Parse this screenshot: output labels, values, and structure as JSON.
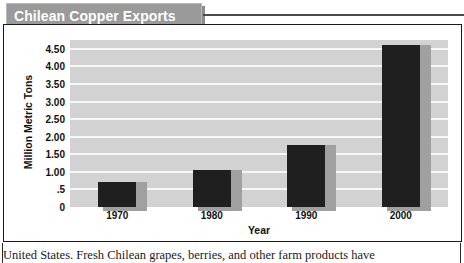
{
  "figure": {
    "title": "Chilean Copper Exports"
  },
  "chart_data": {
    "type": "bar",
    "title": "Chilean Copper Exports",
    "xlabel": "Year",
    "ylabel": "Million Metric Tons",
    "categories": [
      "1970",
      "1980",
      "1990",
      "2000"
    ],
    "values": [
      0.7,
      1.05,
      1.75,
      4.6
    ],
    "ylim": [
      0,
      4.75
    ],
    "yticks": [
      0,
      0.5,
      1.0,
      1.5,
      2.0,
      2.5,
      3.0,
      3.5,
      4.0,
      4.5
    ],
    "ytick_labels": [
      "0",
      ".5",
      "1.00",
      "1.50",
      "2.00",
      "2.50",
      "3.00",
      "3.50",
      "4.00",
      "4.50"
    ],
    "grid": true,
    "legend": "none",
    "colors": {
      "bar": "#1f1f1f",
      "bar_shadow": "#a0a0a0",
      "plot_background": "#d2d2d2",
      "gridline": "#f7f7f7",
      "title_banner": "#9a9a9a",
      "title_text": "#ffffff"
    }
  },
  "page_body": {
    "text": "United States. Fresh Chilean grapes, berries, and other farm products have"
  }
}
